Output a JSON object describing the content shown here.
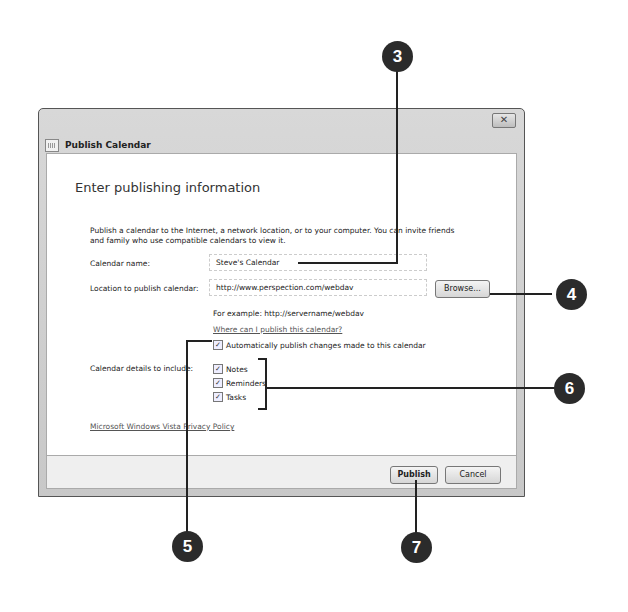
{
  "window": {
    "title": "Publish Calendar",
    "close_label": "✕"
  },
  "content": {
    "heading": "Enter publishing information",
    "description": "Publish a calendar to the Internet, a network location, or to your computer. You can invite friends and family who use compatible calendars to view it.",
    "calendar_name_label": "Calendar name:",
    "calendar_name_value": "Steve's Calendar",
    "location_label": "Location to publish calendar:",
    "location_value": "http://www.perspection.com/webdav",
    "browse_label": "Browse...",
    "example_text": "For example: http://servername/webdav",
    "where_link": "Where can I publish this calendar?",
    "auto_publish_label": "Automatically publish changes made to this calendar",
    "details_label": "Calendar details to include:",
    "details": [
      {
        "label": "Notes",
        "checked": true
      },
      {
        "label": "Reminders",
        "checked": true
      },
      {
        "label": "Tasks",
        "checked": true
      }
    ],
    "privacy_link": "Microsoft Windows Vista Privacy Policy"
  },
  "footer": {
    "publish_label": "Publish",
    "cancel_label": "Cancel"
  },
  "callouts": [
    "3",
    "4",
    "5",
    "6",
    "7"
  ],
  "check_glyph": "✓"
}
